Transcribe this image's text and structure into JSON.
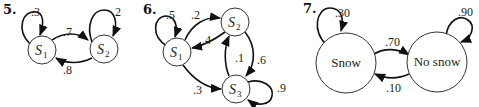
{
  "diagrams": [
    {
      "number": "5.",
      "states": [
        {
          "name": "S",
          "sub": "1"
        },
        {
          "name": "S",
          "sub": "2"
        }
      ],
      "transitions": [
        {
          "from": "S1",
          "to": "S1",
          "p": ".3"
        },
        {
          "from": "S1",
          "to": "S2",
          "p": ".7"
        },
        {
          "from": "S2",
          "to": "S1",
          "p": ".8"
        },
        {
          "from": "S2",
          "to": "S2",
          "p": ".2"
        }
      ]
    },
    {
      "number": "6.",
      "states": [
        {
          "name": "S",
          "sub": "1"
        },
        {
          "name": "S",
          "sub": "2"
        },
        {
          "name": "S",
          "sub": "3"
        }
      ],
      "transitions": [
        {
          "from": "S1",
          "to": "S1",
          "p": ".5"
        },
        {
          "from": "S1",
          "to": "S2",
          "p": ".2"
        },
        {
          "from": "S2",
          "to": "S1",
          "p": ".4"
        },
        {
          "from": "S3",
          "to": "S2",
          "p": ".1"
        },
        {
          "from": "S2",
          "to": "S3",
          "p": ".6"
        },
        {
          "from": "S1",
          "to": "S3",
          "p": ".3"
        },
        {
          "from": "S3",
          "to": "S3",
          "p": ".9"
        }
      ]
    },
    {
      "number": "7.",
      "states": [
        {
          "name": "Snow"
        },
        {
          "name": "No snow"
        }
      ],
      "transitions": [
        {
          "from": "Snow",
          "to": "Snow",
          "p": ".30"
        },
        {
          "from": "Snow",
          "to": "No snow",
          "p": ".70"
        },
        {
          "from": "No snow",
          "to": "Snow",
          "p": ".10"
        },
        {
          "from": "No snow",
          "to": "No snow",
          "p": ".90"
        }
      ]
    }
  ]
}
